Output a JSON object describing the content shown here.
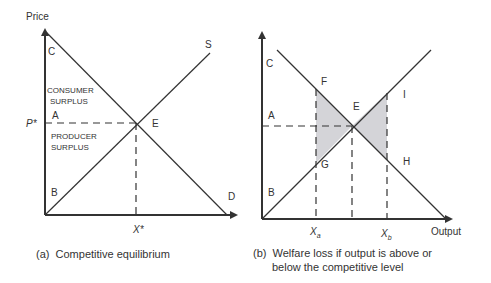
{
  "panel_a": {
    "y_axis_label": "Price",
    "point_labels": {
      "C": "C",
      "A": "A",
      "B": "B",
      "E": "E",
      "S": "S",
      "D": "D"
    },
    "price_label": "P*",
    "quantity_label": "X*",
    "consumer_surplus_line1": "CONSUMER",
    "consumer_surplus_line2": "SURPLUS",
    "producer_surplus_line1": "PRODUCER",
    "producer_surplus_line2": "SURPLUS",
    "caption": "(a)  Competitive equilibrium"
  },
  "panel_b": {
    "point_labels": {
      "C": "C",
      "A": "A",
      "B": "B",
      "E": "E",
      "F": "F",
      "G": "G",
      "H": "H",
      "I": "I"
    },
    "xa_label": "X",
    "xa_sub": "a",
    "xb_label": "X",
    "xb_sub": "b",
    "x_axis_label": "Output",
    "caption_line1": "(b)  Welfare loss if output is above or",
    "caption_line2": "below the competitive level"
  },
  "colors": {
    "line": "#333333",
    "shade": "#d4d4d8"
  }
}
